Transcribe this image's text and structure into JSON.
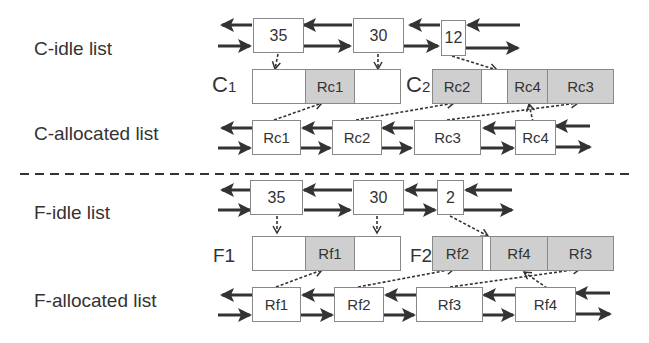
{
  "colors": {
    "line": "#333333",
    "box_border": "#888888",
    "shaded": "#cfcfcf",
    "background": "#ffffff"
  },
  "sections": {
    "c": {
      "idle_label": "C-idle list",
      "allocated_label": "C-allocated list",
      "idle_nodes": [
        "35",
        "30",
        "12"
      ],
      "segment1_label": "C",
      "segment1_sub": "1",
      "segment2_label": "C",
      "segment2_sub": "2",
      "seg1_cells": [
        "",
        "Rc1",
        ""
      ],
      "seg2_cells": [
        "Rc2",
        "",
        "Rc4",
        "Rc3"
      ],
      "allocated_nodes": [
        "Rc1",
        "Rc2",
        "Rc3",
        "Rc4"
      ]
    },
    "f": {
      "idle_label": "F-idle list",
      "allocated_label": "F-allocated list",
      "idle_nodes": [
        "35",
        "30",
        "2"
      ],
      "segment1_label": "F1",
      "segment2_label": "F2",
      "seg1_cells": [
        "",
        "Rf1",
        ""
      ],
      "seg2_cells": [
        "Rf2",
        "",
        "Rf4",
        "Rf3"
      ],
      "allocated_nodes": [
        "Rf1",
        "Rf2",
        "Rf3",
        "Rf4"
      ]
    }
  }
}
